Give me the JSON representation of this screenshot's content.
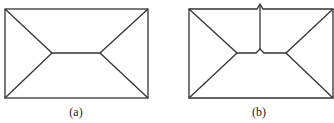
{
  "figures": [
    {
      "id": "a",
      "caption": "(a)",
      "description": "rectangle with hip-roof skeleton lines"
    },
    {
      "id": "b",
      "caption": "(b)",
      "description": "rectangle with skeleton lines and a vertical split from top edge"
    }
  ],
  "colors": {
    "stroke": "#333333",
    "background": "#ffffff"
  }
}
